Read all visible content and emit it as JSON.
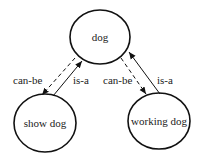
{
  "diagram": {
    "nodes": [
      {
        "id": "dog",
        "label": "dog"
      },
      {
        "id": "show_dog",
        "label": "show dog"
      },
      {
        "id": "working_dog",
        "label": "working dog"
      }
    ],
    "edges": [
      {
        "from": "dog",
        "to": "show_dog",
        "label": "can-be",
        "style": "dashed"
      },
      {
        "from": "show_dog",
        "to": "dog",
        "label": "is-a",
        "style": "solid"
      },
      {
        "from": "dog",
        "to": "working_dog",
        "label": "can-be",
        "style": "dashed"
      },
      {
        "from": "working_dog",
        "to": "dog",
        "label": "is-a",
        "style": "solid"
      }
    ]
  }
}
